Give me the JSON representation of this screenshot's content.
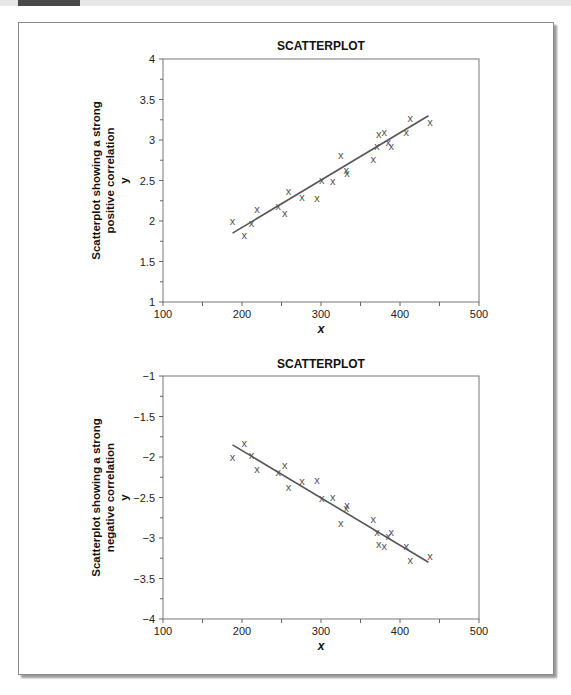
{
  "header": {
    "tab_color": "#4a4a4a",
    "bar_color": "#e6e6e6"
  },
  "chart_data": [
    {
      "type": "scatter",
      "title": "SCATTERPLOT",
      "xlabel": "x",
      "ylabel_lines": [
        "Scatterplot showing a strong",
        "positive correlation",
        "y"
      ],
      "xlim": [
        100,
        500
      ],
      "ylim": [
        1,
        4
      ],
      "xticks": [
        100,
        200,
        300,
        400,
        500
      ],
      "yticks": [
        1,
        1.5,
        2,
        2.5,
        3,
        3.5,
        4
      ],
      "ytick_labels": [
        "1",
        "1.5",
        "2",
        "2.5",
        "3",
        "3.5",
        "4"
      ],
      "marker": "x",
      "grid": false,
      "points": [
        [
          188,
          2.0
        ],
        [
          203,
          1.83
        ],
        [
          212,
          1.97
        ],
        [
          219,
          2.15
        ],
        [
          246,
          2.19
        ],
        [
          254,
          2.1
        ],
        [
          259,
          2.37
        ],
        [
          276,
          2.3
        ],
        [
          295,
          2.28
        ],
        [
          301,
          2.51
        ],
        [
          315,
          2.49
        ],
        [
          325,
          2.81
        ],
        [
          332,
          2.63
        ],
        [
          333,
          2.59
        ],
        [
          366,
          2.77
        ],
        [
          371,
          2.92
        ],
        [
          373,
          3.07
        ],
        [
          380,
          3.1
        ],
        [
          385,
          2.98
        ],
        [
          389,
          2.93
        ],
        [
          408,
          3.1
        ],
        [
          413,
          3.27
        ],
        [
          438,
          3.22
        ]
      ],
      "trendline": [
        [
          188,
          1.85
        ],
        [
          436,
          3.3
        ]
      ]
    },
    {
      "type": "scatter",
      "title": "SCATTERPLOT",
      "xlabel": "x",
      "ylabel_lines": [
        "Scatterplot showing a strong",
        "negative correlation",
        "y"
      ],
      "xlim": [
        100,
        500
      ],
      "ylim": [
        -4,
        -1
      ],
      "xticks": [
        100,
        200,
        300,
        400,
        500
      ],
      "yticks": [
        -4,
        -3.5,
        -3,
        -2.5,
        -2,
        -1.5,
        -1
      ],
      "ytick_labels": [
        "−4",
        "−3.5",
        "−3",
        "−2.5",
        "−2",
        "−1.5",
        "−1"
      ],
      "marker": "x",
      "grid": false,
      "points": [
        [
          188,
          -2.0
        ],
        [
          203,
          -1.83
        ],
        [
          212,
          -1.97
        ],
        [
          219,
          -2.15
        ],
        [
          246,
          -2.19
        ],
        [
          254,
          -2.1
        ],
        [
          259,
          -2.37
        ],
        [
          276,
          -2.3
        ],
        [
          295,
          -2.28
        ],
        [
          301,
          -2.51
        ],
        [
          315,
          -2.49
        ],
        [
          325,
          -2.81
        ],
        [
          332,
          -2.63
        ],
        [
          333,
          -2.59
        ],
        [
          366,
          -2.77
        ],
        [
          371,
          -2.92
        ],
        [
          373,
          -3.07
        ],
        [
          380,
          -3.1
        ],
        [
          385,
          -2.98
        ],
        [
          389,
          -2.93
        ],
        [
          408,
          -3.1
        ],
        [
          413,
          -3.27
        ],
        [
          438,
          -3.22
        ]
      ],
      "trendline": [
        [
          188,
          -1.85
        ],
        [
          436,
          -3.3
        ]
      ]
    }
  ]
}
